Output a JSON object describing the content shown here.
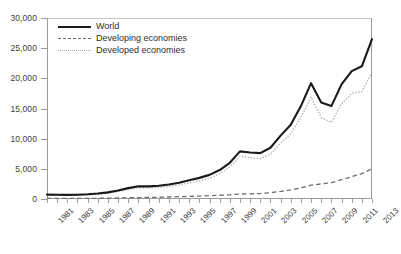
{
  "chart_data": {
    "type": "line",
    "title": "",
    "xlabel": "",
    "ylabel": "",
    "ylim": [
      0,
      30000
    ],
    "ytick_values": [
      0,
      5000,
      10000,
      15000,
      20000,
      25000,
      30000
    ],
    "ytick_labels": [
      "0",
      "5,000",
      "10,000",
      "15,000",
      "20,000",
      "25,000",
      "30,000"
    ],
    "xlim": [
      1981,
      2013
    ],
    "x": [
      1981,
      1982,
      1983,
      1984,
      1985,
      1986,
      1987,
      1988,
      1989,
      1990,
      1991,
      1992,
      1993,
      1994,
      1995,
      1996,
      1997,
      1998,
      1999,
      2000,
      2001,
      2002,
      2003,
      2004,
      2005,
      2006,
      2007,
      2008,
      2009,
      2010,
      2011,
      2012,
      2013
    ],
    "xtick_labels": [
      "1981",
      "1983",
      "1985",
      "1987",
      "1989",
      "1991",
      "1993",
      "1995",
      "1997",
      "1999",
      "2001",
      "2003",
      "2005",
      "2007",
      "2009",
      "2011",
      "2013"
    ],
    "grid": false,
    "legend_position": "top-left",
    "series": [
      {
        "name": "World",
        "style": "solid",
        "color": "#1a1a1a",
        "values": [
          730,
          700,
          690,
          710,
          780,
          900,
          1100,
          1400,
          1800,
          2100,
          2100,
          2200,
          2400,
          2700,
          3100,
          3500,
          4000,
          4800,
          6000,
          7900,
          7700,
          7600,
          8500,
          10500,
          12300,
          15400,
          19200,
          16000,
          15400,
          19000,
          21200,
          22000,
          26500
        ]
      },
      {
        "name": "Developing economies",
        "style": "dashed",
        "color": "#6f6f6f",
        "values": [
          90,
          90,
          95,
          100,
          110,
          120,
          140,
          170,
          200,
          240,
          260,
          290,
          330,
          380,
          430,
          490,
          560,
          620,
          700,
          820,
          850,
          900,
          1050,
          1250,
          1500,
          1850,
          2300,
          2500,
          2700,
          3200,
          3700,
          4200,
          5000
        ]
      },
      {
        "name": "Developed economies",
        "style": "dotted",
        "color": "#b2b2b2",
        "values": [
          640,
          610,
          600,
          615,
          670,
          780,
          960,
          1230,
          1600,
          1860,
          1840,
          1910,
          2070,
          2320,
          2670,
          3010,
          3440,
          4180,
          5300,
          7080,
          6850,
          6700,
          7450,
          9250,
          10800,
          13550,
          16900,
          13500,
          12700,
          15800,
          17500,
          17800,
          21000
        ]
      }
    ]
  },
  "legend": {
    "items": [
      {
        "label": "World",
        "style": "solid"
      },
      {
        "label": "Developing economies",
        "style": "dashed"
      },
      {
        "label": "Developed economies",
        "style": "dotted"
      }
    ]
  }
}
